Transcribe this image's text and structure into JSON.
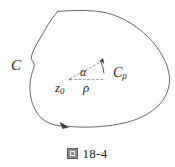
{
  "figure": {
    "caption_glyph": "figure-cjk-char",
    "caption_number": "18-4",
    "labels": {
      "contour_outer": "C",
      "contour_small_base": "C",
      "contour_small_sub": "ρ",
      "point_base": "z",
      "point_sub": "0",
      "radius": "ρ",
      "angle": "α"
    },
    "colors": {
      "stroke": "#555555",
      "dashed_stroke": "#9a9a9a",
      "text": "#1a1a1a",
      "background": "#ffffff",
      "caption_glyph_fill": "#8f8f8f"
    },
    "geometry": {
      "outer_contour_direction": "counterclockwise",
      "arrow_on_outer_contour_at": "bottom-left",
      "small_arc_direction": "counterclockwise",
      "center_point": [
        72,
        79
      ],
      "small_arc_radius_px": 34
    }
  }
}
